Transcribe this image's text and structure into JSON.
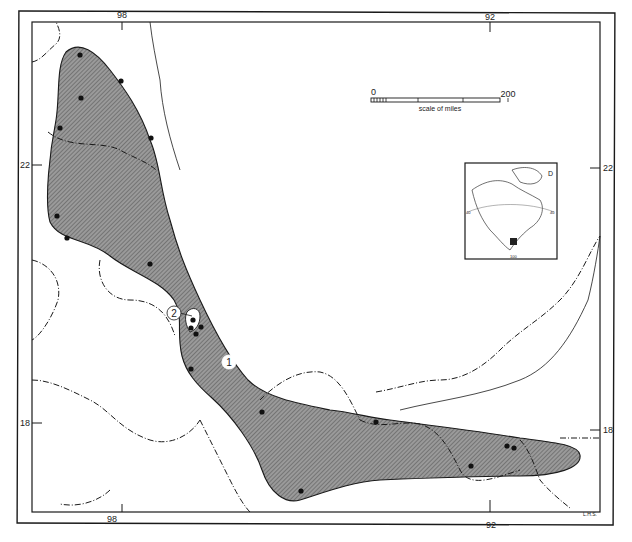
{
  "map": {
    "longitude_ticks_top": [
      "98",
      "92"
    ],
    "longitude_ticks_bottom": [
      "98",
      "92"
    ],
    "latitude_ticks_left": [
      "22",
      "18"
    ],
    "latitude_ticks_right": [
      "22",
      "18"
    ],
    "scale_bar": {
      "start": "0",
      "end": "200",
      "caption": "scale of miles"
    },
    "range_labels": [
      "1",
      "2"
    ],
    "inset": {
      "label": "D",
      "graticule_labels": [
        "40",
        "40",
        "100"
      ]
    },
    "credit": "L.H.S.",
    "colors": {
      "range_fill": "#8a8a8a",
      "line": "#1a1a1a",
      "background": "#ffffff"
    }
  }
}
